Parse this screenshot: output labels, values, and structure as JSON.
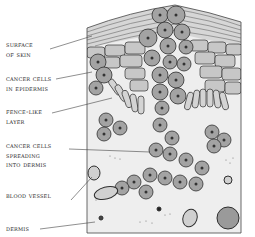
{
  "figure": {
    "labels": [
      {
        "id": "surface",
        "lines": [
          "Surface",
          "of skin"
        ],
        "top": 44
      },
      {
        "id": "epidermis",
        "lines": [
          "Cancer cells",
          "in epidermis"
        ],
        "top": 77
      },
      {
        "id": "fence",
        "lines": [
          "Fence-like",
          "layer"
        ],
        "top": 110
      },
      {
        "id": "spreading",
        "lines": [
          "Cancer cells",
          "spreading",
          "into dermis"
        ],
        "top": 145
      },
      {
        "id": "vessel",
        "lines": [
          "Blood vessel"
        ],
        "top": 191
      },
      {
        "id": "dermis",
        "lines": [
          "Dermis"
        ],
        "top": 228
      }
    ]
  },
  "colors": {
    "line": "#3a3a3a",
    "cell_fill": "#b9b9b9",
    "cancer_cell_fill": "#9a9a9a",
    "nucleus": "#3c3c3c",
    "dermis_fill": "#ececec",
    "background": "#ffffff"
  }
}
